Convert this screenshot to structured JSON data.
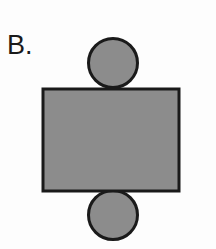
{
  "figure": {
    "panel_label": "B.",
    "background_color": "#fdfdfd",
    "shape_fill_color": "#8c8c8c",
    "shape_stroke_color": "#1a1a1a",
    "label_color": "#1a1a1a",
    "canvas": {
      "width": 216,
      "height": 249
    },
    "shapes": [
      {
        "name": "top-circle",
        "type": "circle",
        "cx": 113,
        "cy": 63,
        "r": 24.5,
        "stroke_width": 3,
        "fill": "#8c8c8c",
        "stroke": "#1a1a1a"
      },
      {
        "name": "bottom-circle",
        "type": "circle",
        "cx": 113,
        "cy": 215,
        "r": 24.5,
        "stroke_width": 3,
        "fill": "#8c8c8c",
        "stroke": "#1a1a1a"
      },
      {
        "name": "center-rectangle",
        "type": "rect",
        "x": 43,
        "y": 89,
        "width": 136,
        "height": 102,
        "stroke_width": 3,
        "fill": "#8c8c8c",
        "stroke": "#1a1a1a"
      }
    ]
  }
}
